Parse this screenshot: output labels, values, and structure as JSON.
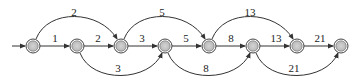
{
  "diagram": {
    "type": "state-graph",
    "node_fill": "#c8c8c8",
    "stroke": "#333333",
    "nodes": [
      {
        "id": 1,
        "x": 33
      },
      {
        "id": 2,
        "x": 77
      },
      {
        "id": 3,
        "x": 121
      },
      {
        "id": 4,
        "x": 165
      },
      {
        "id": 5,
        "x": 209
      },
      {
        "id": 6,
        "x": 253
      },
      {
        "id": 7,
        "x": 297
      },
      {
        "id": 8,
        "x": 341
      }
    ],
    "straight_edges": [
      {
        "from": 1,
        "to": 2,
        "label": "1"
      },
      {
        "from": 2,
        "to": 3,
        "label": "2"
      },
      {
        "from": 3,
        "to": 4,
        "label": "3"
      },
      {
        "from": 4,
        "to": 5,
        "label": "5"
      },
      {
        "from": 5,
        "to": 6,
        "label": "8"
      },
      {
        "from": 6,
        "to": 7,
        "label": "13"
      },
      {
        "from": 7,
        "to": 8,
        "label": "21"
      }
    ],
    "upper_arcs": [
      {
        "from": 1,
        "to": 3,
        "label": "2"
      },
      {
        "from": 3,
        "to": 5,
        "label": "5"
      },
      {
        "from": 5,
        "to": 7,
        "label": "13"
      }
    ],
    "lower_arcs": [
      {
        "from": 2,
        "to": 4,
        "label": "3"
      },
      {
        "from": 4,
        "to": 6,
        "label": "8"
      },
      {
        "from": 6,
        "to": 8,
        "label": "21"
      }
    ]
  }
}
